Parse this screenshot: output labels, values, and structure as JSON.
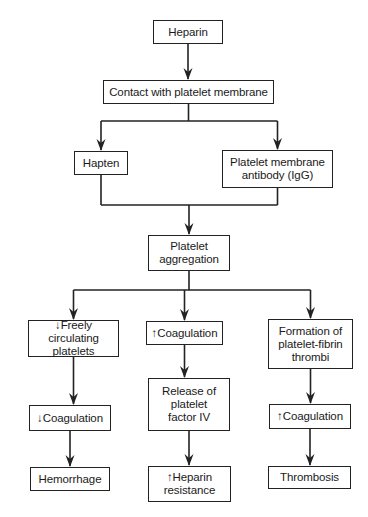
{
  "diagram": {
    "type": "flowchart",
    "nodes": [
      {
        "id": "heparin",
        "label": "Heparin",
        "x": 153,
        "y": 20,
        "w": 70,
        "h": 24
      },
      {
        "id": "contact",
        "label": "Contact with platelet membrane",
        "x": 103,
        "y": 80,
        "w": 171,
        "h": 24
      },
      {
        "id": "hapten",
        "label": "Hapten",
        "x": 74,
        "y": 151,
        "w": 54,
        "h": 24
      },
      {
        "id": "antibody",
        "label": "Platelet membrane antibody (IgG)",
        "x": 222,
        "y": 150,
        "w": 111,
        "h": 38
      },
      {
        "id": "aggregation",
        "label": "Platelet aggregation",
        "x": 148,
        "y": 235,
        "w": 82,
        "h": 36
      },
      {
        "id": "freely",
        "label": "↓Freely circulating platelets",
        "x": 28,
        "y": 320,
        "w": 91,
        "h": 37
      },
      {
        "id": "coag_up_mid",
        "label": "↑Coagulation",
        "x": 146,
        "y": 321,
        "w": 77,
        "h": 24
      },
      {
        "id": "formation",
        "label": "Formation of platelet-fibrin thrombi",
        "x": 268,
        "y": 319,
        "w": 85,
        "h": 50
      },
      {
        "id": "coag_down",
        "label": "↓Coagulation",
        "x": 29,
        "y": 405,
        "w": 82,
        "h": 26
      },
      {
        "id": "release",
        "label": "Release of platelet factor IV",
        "x": 148,
        "y": 378,
        "w": 82,
        "h": 53
      },
      {
        "id": "coag_up_right",
        "label": "↑Coagulation",
        "x": 269,
        "y": 404,
        "w": 82,
        "h": 25
      },
      {
        "id": "hemorrhage",
        "label": "Hemorrhage",
        "x": 30,
        "y": 467,
        "w": 80,
        "h": 24
      },
      {
        "id": "heparin_resistance",
        "label": "↑Heparin resistance",
        "x": 148,
        "y": 466,
        "w": 83,
        "h": 36
      },
      {
        "id": "thrombosis",
        "label": "Thrombosis",
        "x": 268,
        "y": 466,
        "w": 83,
        "h": 23
      }
    ],
    "edges": [
      {
        "from": "heparin",
        "to": "contact"
      },
      {
        "from": "contact",
        "to": "hapten"
      },
      {
        "from": "contact",
        "to": "antibody"
      },
      {
        "from": "hapten",
        "to": "aggregation"
      },
      {
        "from": "antibody",
        "to": "aggregation"
      },
      {
        "from": "aggregation",
        "to": "freely"
      },
      {
        "from": "aggregation",
        "to": "coag_up_mid"
      },
      {
        "from": "aggregation",
        "to": "formation"
      },
      {
        "from": "freely",
        "to": "coag_down"
      },
      {
        "from": "coag_up_mid",
        "to": "release"
      },
      {
        "from": "formation",
        "to": "coag_up_right"
      },
      {
        "from": "coag_down",
        "to": "hemorrhage"
      },
      {
        "from": "release",
        "to": "heparin_resistance"
      },
      {
        "from": "coag_up_right",
        "to": "thrombosis"
      }
    ],
    "connectors": {
      "split1_y": 121,
      "join_y": 205,
      "split2_y": 290
    },
    "colors": {
      "line": "#222222",
      "background": "#ffffff",
      "text": "#1a1a1a"
    }
  }
}
